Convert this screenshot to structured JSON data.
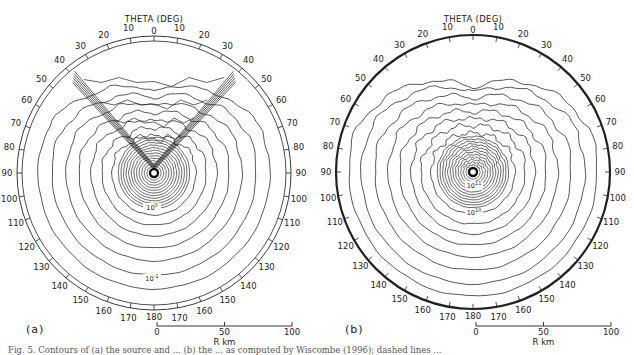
{
  "figure": {
    "panels": [
      {
        "id": "a",
        "label": "(a)",
        "axis_title": "THETA (DEG)",
        "center": [
          154,
          173
        ],
        "outer_radius": 137,
        "double_ring": true,
        "theta_ticks": [
          0,
          10,
          20,
          30,
          40,
          50,
          60,
          70,
          80,
          90,
          100,
          110,
          120,
          130,
          140,
          150,
          160,
          170,
          180
        ],
        "theta_labels_left": [
          "10",
          "20",
          "30",
          "40",
          "50",
          "60",
          "70",
          "80",
          "90",
          "100",
          "110",
          "120",
          "130",
          "140",
          "150",
          "160",
          "170"
        ],
        "theta_labels_right": [
          "10",
          "20",
          "30",
          "40",
          "50",
          "60",
          "70",
          "80",
          "90",
          "100",
          "110",
          "120",
          "130",
          "140",
          "150",
          "160",
          "170"
        ],
        "theta_top_label": "0",
        "theta_bottom_label": "180",
        "contour_labels": [
          {
            "text": "10",
            "sup": "0",
            "pos": [
              152,
              210
            ]
          },
          {
            "text": "10",
            "sup": "-1",
            "pos": [
              152,
              281
            ]
          }
        ],
        "scale_bar": {
          "ticks": [
            "0",
            "50",
            "100"
          ],
          "unit_label": "R km"
        }
      },
      {
        "id": "b",
        "label": "(b)",
        "axis_title": "THETA (DEG)",
        "center": [
          473,
          172
        ],
        "outer_radius": 137,
        "double_ring": false,
        "theta_ticks": [
          0,
          10,
          20,
          30,
          40,
          50,
          60,
          70,
          80,
          90,
          100,
          110,
          120,
          130,
          140,
          150,
          160,
          170,
          180
        ],
        "theta_labels_left": [
          "10",
          "20",
          "30",
          "40",
          "50",
          "60",
          "70",
          "80",
          "90",
          "100",
          "110",
          "120",
          "130",
          "140",
          "150",
          "160",
          "170"
        ],
        "theta_labels_right": [
          "10",
          "20",
          "30",
          "40",
          "50",
          "60",
          "70",
          "80",
          "90",
          "100",
          "110",
          "120",
          "130",
          "140",
          "150",
          "160",
          "170"
        ],
        "theta_top_label": "0",
        "theta_bottom_label": "180",
        "contour_labels": [
          {
            "text": "10",
            "sup": "11",
            "pos": [
              474,
              188
            ]
          },
          {
            "text": "10",
            "sup": "10",
            "pos": [
              474,
              215
            ]
          }
        ],
        "scale_bar": {
          "ticks": [
            "0",
            "50",
            "100"
          ],
          "unit_label": "R km"
        }
      }
    ],
    "caption": "Fig. 5. Contours of (a) the source and ... (b) the ... as computed by Wiscombe (1996); dashed lines ..."
  }
}
